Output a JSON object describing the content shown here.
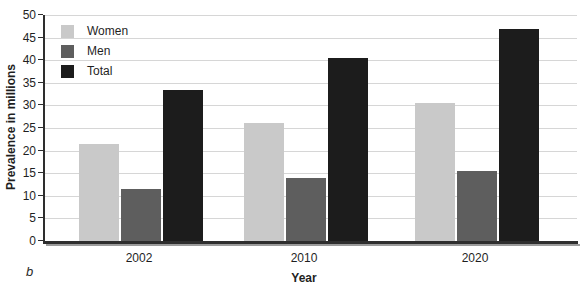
{
  "figure": {
    "panel_label": "b"
  },
  "chart_data": {
    "type": "bar",
    "title": "",
    "xlabel": "Year",
    "ylabel": "Prevalence in millions",
    "categories": [
      "2002",
      "2010",
      "2020"
    ],
    "series": [
      {
        "name": "Women",
        "color": "#c9c9c9",
        "values": [
          21.5,
          26,
          30.5
        ]
      },
      {
        "name": "Men",
        "color": "#5e5e5e",
        "values": [
          11.5,
          14,
          15.5
        ]
      },
      {
        "name": "Total",
        "color": "#1c1c1c",
        "values": [
          33.5,
          40.5,
          47
        ]
      }
    ],
    "ylim": [
      0,
      50
    ],
    "ytick_step": 5,
    "grid": "horizontal",
    "legend_position": "top-left"
  }
}
